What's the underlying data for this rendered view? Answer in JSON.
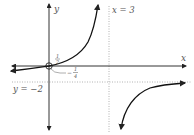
{
  "diagram": {
    "type": "rational-function-graph",
    "axes": {
      "x_label": "x",
      "y_label": "y"
    },
    "asymptotes": {
      "vertical_label": "x = 3",
      "horizontal_label": "y = −2"
    },
    "annotations": {
      "y_intercept_num": "1",
      "y_intercept_den": "2",
      "x_intercept_sign": "−",
      "x_intercept_num": "1",
      "x_intercept_den": "4"
    },
    "colors": {
      "curve": "#111111",
      "axis": "#333333",
      "asymptote": "#999999",
      "label": "#555555"
    }
  }
}
